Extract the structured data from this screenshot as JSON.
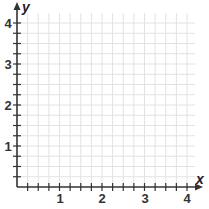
{
  "figure": {
    "type": "coordinate-grid",
    "x_axis": {
      "label": "x",
      "ticks": [
        "1",
        "2",
        "3",
        "4"
      ],
      "min": 0,
      "max": 4,
      "subdivisions_per_unit": 4
    },
    "y_axis": {
      "label": "y",
      "ticks": [
        "1",
        "2",
        "3",
        "4"
      ],
      "min": 0,
      "max": 4,
      "subdivisions_per_unit": 4
    },
    "colors": {
      "grid": "#e2e2e2",
      "axis": "#333333",
      "text": "#333333"
    }
  }
}
